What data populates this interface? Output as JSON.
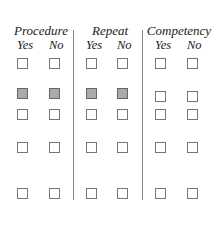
{
  "groups": [
    {
      "title": "Procedure",
      "yes": "Yes",
      "no": "No"
    },
    {
      "title": "Repeat",
      "yes": "Yes",
      "no": "No"
    },
    {
      "title": "Competency",
      "yes": "Yes",
      "no": "No"
    }
  ],
  "rows": [
    {
      "shaded": [
        false,
        false,
        false,
        false,
        false,
        false
      ]
    },
    {
      "shaded": [
        true,
        true,
        true,
        true,
        false,
        false
      ]
    },
    {
      "shaded": [
        false,
        false,
        false,
        false,
        false,
        false
      ]
    },
    {
      "shaded": [
        false,
        false,
        false,
        false,
        false,
        false
      ]
    },
    {
      "shaded": [
        false,
        false,
        false,
        false,
        false,
        false
      ]
    }
  ]
}
